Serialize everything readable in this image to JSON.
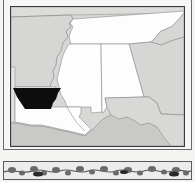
{
  "map": {
    "title": "",
    "highlighted_region": "north-louisiana-band",
    "colors": {
      "background_state": "#d8d8d6",
      "region_white": "#fdfdfd",
      "highlight": "#0d0d0d",
      "water": "#c9c9c7",
      "boundary": "#8a8a8a",
      "frame": "#3a3a3a"
    },
    "regions": [
      {
        "name": "arkansas",
        "fill": "gray"
      },
      {
        "name": "tennessee",
        "fill": "white"
      },
      {
        "name": "mississippi",
        "fill": "white"
      },
      {
        "name": "alabama",
        "fill": "white"
      },
      {
        "name": "georgia",
        "fill": "gray"
      },
      {
        "name": "louisiana",
        "fill": "white"
      },
      {
        "name": "highlighted-band",
        "fill": "black"
      },
      {
        "name": "florida-panhandle",
        "fill": "gray"
      },
      {
        "name": "gulf-of-mexico",
        "fill": "water"
      }
    ]
  },
  "decorative_border": {
    "motif": "floral-vine"
  }
}
